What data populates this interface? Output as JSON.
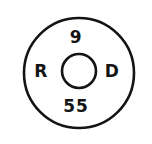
{
  "figure": {
    "kind": "annotated-concentric-circle-symbol",
    "background_color": "#ffffff",
    "ink_color": "#141414",
    "outer_circle": {
      "center_x": 79,
      "center_y": 73,
      "radius": 55,
      "stroke_width": 2.6
    },
    "inner_circle": {
      "center_x": 79,
      "center_y": 71,
      "radius": 17,
      "stroke_width": 2.6
    },
    "labels": {
      "top": "9",
      "bottom": "55",
      "left": "R",
      "right": "D"
    }
  }
}
